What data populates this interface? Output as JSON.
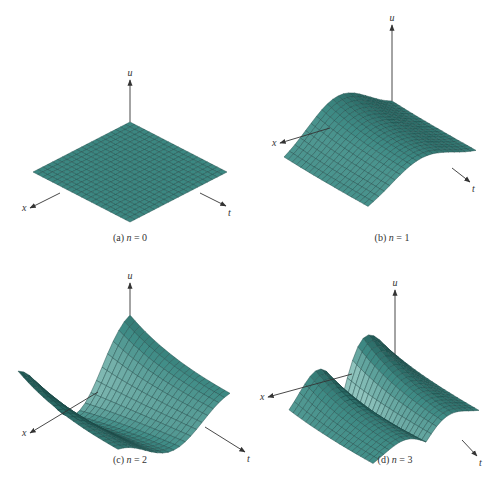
{
  "figure": {
    "panels": [
      {
        "id": "a",
        "caption_prefix": "(a) ",
        "caption_var": "n",
        "caption_suffix": " = 0",
        "n": 0,
        "axes": {
          "u": "u",
          "x": "x",
          "t": "t"
        },
        "origin": [
          130,
          122
        ],
        "ex": [
          -4.85,
          2.5
        ],
        "et": [
          4.85,
          2.5
        ],
        "ez": 22,
        "u_axis_top": [
          130,
          80
        ],
        "x_arrow_end": [
          30,
          208
        ],
        "x_arrow_start": [
          60,
          193
        ],
        "t_arrow_end": [
          226,
          206
        ],
        "t_arrow_start": [
          200,
          193
        ],
        "caption_pos": [
          130,
          241
        ]
      },
      {
        "id": "b",
        "caption_prefix": "(b) ",
        "caption_var": "n",
        "caption_suffix": " = 1",
        "n": 1,
        "axes": {
          "u": "u",
          "x": "x",
          "t": "t"
        },
        "origin": [
          392,
          110
        ],
        "ex": [
          -5.4,
          2.8
        ],
        "et": [
          4.2,
          2.3
        ],
        "ez": 42,
        "u_axis_top": [
          392,
          25
        ],
        "x_arrow_end": [
          280,
          143
        ],
        "x_arrow_start": [
          330,
          128
        ],
        "t_arrow_end": [
          470,
          182
        ],
        "t_arrow_start": [
          452,
          168
        ],
        "caption_pos": [
          392,
          241
        ]
      },
      {
        "id": "c",
        "caption_prefix": "(c) ",
        "caption_var": "n",
        "caption_suffix": " = 2",
        "n": 2,
        "axes": {
          "u": "u",
          "x": "x",
          "t": "t"
        },
        "origin": [
          130,
          372
        ],
        "ex": [
          -5.6,
          2.8
        ],
        "et": [
          5.0,
          2.2
        ],
        "ez": 42,
        "u_axis_top": [
          130,
          283
        ],
        "x_arrow_end": [
          30,
          433
        ],
        "x_arrow_start": [
          98,
          392
        ],
        "t_arrow_end": [
          245,
          452
        ],
        "t_arrow_start": [
          205,
          427
        ],
        "caption_pos": [
          130,
          463
        ]
      },
      {
        "id": "d",
        "caption_prefix": "(d) ",
        "caption_var": "n",
        "caption_suffix": " = 3",
        "n": 3,
        "axes": {
          "u": "u",
          "x": "x",
          "t": "t"
        },
        "origin": [
          395,
          372
        ],
        "ex": [
          -5.3,
          2.6
        ],
        "et": [
          4.2,
          2.2
        ],
        "ez": 45,
        "u_axis_top": [
          395,
          290
        ],
        "x_arrow_end": [
          268,
          397
        ],
        "x_arrow_start": [
          352,
          374
        ],
        "t_arrow_end": [
          477,
          456
        ],
        "t_arrow_start": [
          462,
          440
        ],
        "caption_pos": [
          395,
          463
        ]
      }
    ],
    "grid_divisions": 20,
    "surface_color": "#3f8c86",
    "surface_light": "#8fc3bd",
    "surface_dark": "#1f5753",
    "mesh_color": "#1e4a48",
    "axis_color": "#333333"
  }
}
